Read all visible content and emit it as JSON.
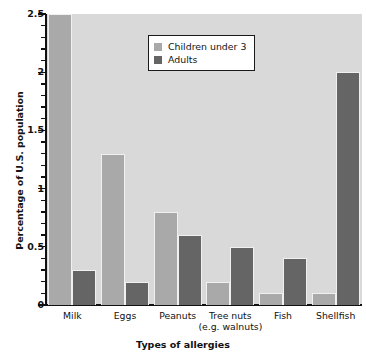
{
  "chart_data": {
    "type": "bar",
    "title": "",
    "xlabel": "Types of allergies",
    "ylabel": "Percentage of U.S. population",
    "categories": [
      "Milk",
      "Eggs",
      "Peanuts",
      "Tree nuts\n(e.g. walnuts)",
      "Fish",
      "Shellfish"
    ],
    "category_labels": [
      {
        "line1": "Milk",
        "line2": ""
      },
      {
        "line1": "Eggs",
        "line2": ""
      },
      {
        "line1": "Peanuts",
        "line2": ""
      },
      {
        "line1": "Tree nuts",
        "line2": "(e.g. walnuts)"
      },
      {
        "line1": "Fish",
        "line2": ""
      },
      {
        "line1": "Shellfish",
        "line2": ""
      }
    ],
    "series": [
      {
        "name": "Children under 3",
        "color": "#a9a9a9",
        "values": [
          2.5,
          1.3,
          0.8,
          0.2,
          0.1,
          0.1
        ]
      },
      {
        "name": "Adults",
        "color": "#656565",
        "values": [
          0.3,
          0.2,
          0.6,
          0.5,
          0.4,
          2.0
        ]
      }
    ],
    "ylim": [
      0,
      2.5
    ],
    "ytick_labels": [
      "0",
      "0.5",
      "1",
      "1.5",
      "2",
      "2.5"
    ],
    "ytick_values": [
      0,
      0.5,
      1,
      1.5,
      2,
      2.5
    ],
    "minor_tick_step": 0.1,
    "grid": false,
    "legend_position": "top-center",
    "plot_background": "#d9d9d9",
    "page_background": "#ffffff",
    "axis_color": "#111111"
  },
  "legend": {
    "entries": [
      {
        "label": "Children under 3",
        "swatch": "light"
      },
      {
        "label": "Adults",
        "swatch": "dark"
      }
    ]
  },
  "axes": {
    "y_title": "Percentage of U.S. population",
    "x_title": "Types of allergies"
  }
}
